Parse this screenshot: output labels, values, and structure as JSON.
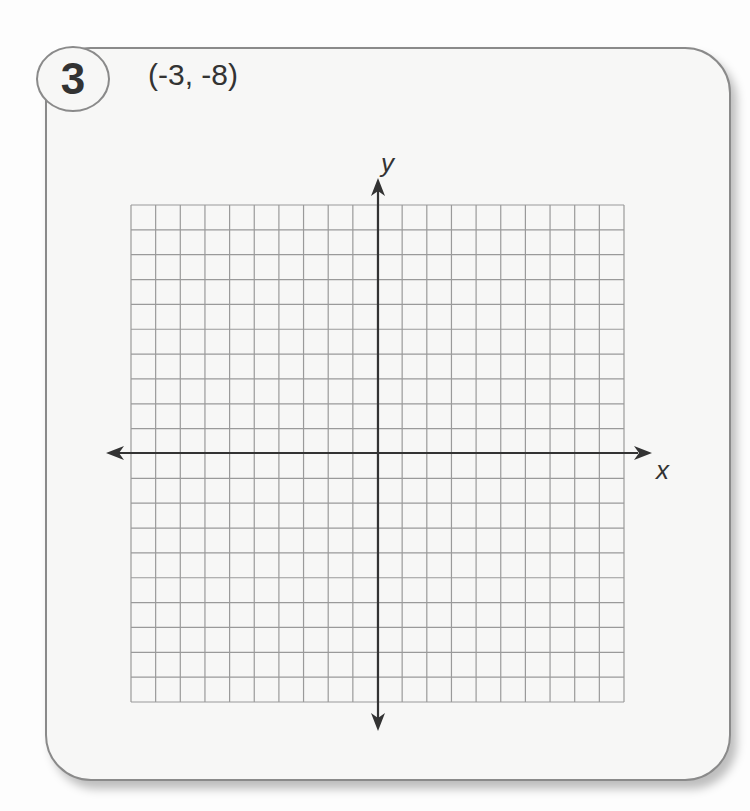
{
  "problem": {
    "number": "3",
    "point_label": "(-3, -8)"
  },
  "graph": {
    "x_axis_label": "x",
    "y_axis_label": "y",
    "grid_cells_x": 20,
    "grid_cells_y": 20,
    "x_range": [
      -10,
      10
    ],
    "y_range": [
      -10,
      10
    ],
    "grid_color": "#9a9a9a",
    "axis_color": "#333333"
  }
}
